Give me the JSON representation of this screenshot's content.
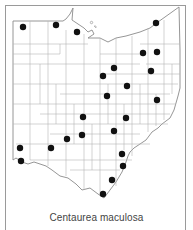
{
  "map": {
    "title": "Centaurea maculosa",
    "region": "Ohio county distribution",
    "colors": {
      "outline": "#8a8a8a",
      "county_lines": "#b5b5b5",
      "dot": "#111111",
      "background": "#ffffff"
    },
    "occurrence_dots": [
      {
        "x": 23,
        "y": 27
      },
      {
        "x": 56,
        "y": 25
      },
      {
        "x": 77,
        "y": 32
      },
      {
        "x": 156,
        "y": 23
      },
      {
        "x": 143,
        "y": 53
      },
      {
        "x": 157,
        "y": 52
      },
      {
        "x": 151,
        "y": 71
      },
      {
        "x": 114,
        "y": 68
      },
      {
        "x": 103,
        "y": 76
      },
      {
        "x": 127,
        "y": 86
      },
      {
        "x": 107,
        "y": 96
      },
      {
        "x": 157,
        "y": 100
      },
      {
        "x": 83,
        "y": 117
      },
      {
        "x": 126,
        "y": 118
      },
      {
        "x": 20,
        "y": 148
      },
      {
        "x": 51,
        "y": 148
      },
      {
        "x": 67,
        "y": 139
      },
      {
        "x": 82,
        "y": 135
      },
      {
        "x": 114,
        "y": 131
      },
      {
        "x": 21,
        "y": 161
      },
      {
        "x": 122,
        "y": 154
      },
      {
        "x": 123,
        "y": 166
      },
      {
        "x": 112,
        "y": 180
      },
      {
        "x": 103,
        "y": 194
      }
    ],
    "dot_count": 24
  }
}
